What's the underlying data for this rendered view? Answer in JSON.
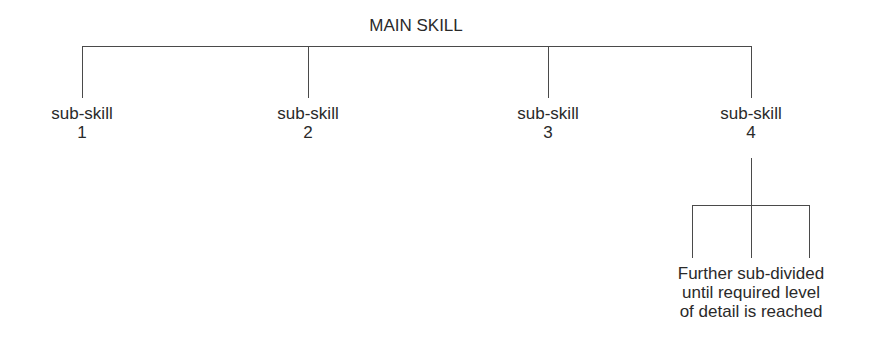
{
  "diagram": {
    "title": "MAIN SKILL",
    "sub_skills": [
      {
        "label": "sub-skill",
        "number": "1"
      },
      {
        "label": "sub-skill",
        "number": "2"
      },
      {
        "label": "sub-skill",
        "number": "3"
      },
      {
        "label": "sub-skill",
        "number": "4"
      }
    ],
    "leaf_note": {
      "line1": "Further sub-divided",
      "line2": "until required level",
      "line3": "of detail is reached"
    }
  }
}
